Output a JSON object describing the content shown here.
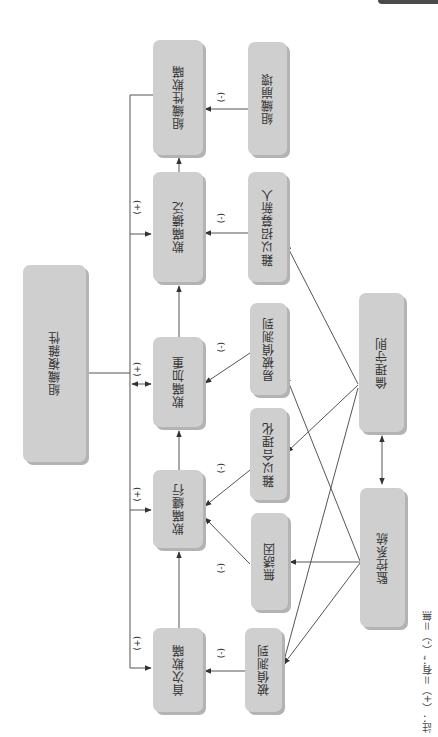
{
  "diagram": {
    "type": "causal-flow",
    "orientation": "rotated-90-ccw",
    "colors": {
      "node_fill": "#cfcfcf",
      "node_shadow": "#b3b3b3",
      "edge": "#555555",
      "text": "#333333"
    },
    "nodes": {
      "org_complexity": "組織複雜性",
      "org_deception": "組織性欺瞞",
      "deception_spread": "欺瞞擴泛",
      "deception_escalate": "欺瞞加重",
      "deception_continue": "欺瞞纏行",
      "first_deception": "首次欺瞞",
      "org_collapse": "組織崩壞",
      "hard_to_recruit": "難以招募新人",
      "easily_detected": "易被偵測到",
      "hard_to_rationalize": "難以合理化",
      "no_incentive": "無誘因",
      "detected": "被偵測到",
      "ethics_code": "倫理守則",
      "monitoring_system": "監控系統"
    },
    "signs": {
      "plus": "(+)",
      "minus": "(-)"
    },
    "edges": [
      {
        "from": "first_deception",
        "to": "deception_continue"
      },
      {
        "from": "deception_continue",
        "to": "deception_escalate"
      },
      {
        "from": "deception_escalate",
        "to": "deception_spread"
      },
      {
        "from": "deception_spread",
        "to": "org_deception"
      },
      {
        "from": "org_collapse",
        "to": "org_deception",
        "sign": "(-)"
      },
      {
        "from": "hard_to_recruit",
        "to": "deception_spread",
        "sign": "(-)"
      },
      {
        "from": "easily_detected",
        "to": "deception_escalate",
        "sign": "(-)"
      },
      {
        "from": "hard_to_rationalize",
        "to": "deception_continue",
        "sign": "(-)"
      },
      {
        "from": "no_incentive",
        "to": "deception_continue",
        "sign": "(-)"
      },
      {
        "from": "detected",
        "to": "first_deception",
        "sign": "(-)"
      },
      {
        "from": "org_complexity",
        "to": "deception_spread",
        "sign": "(+)"
      },
      {
        "from": "org_complexity",
        "to": "deception_escalate",
        "sign": "(+)",
        "bidirectional": true
      },
      {
        "from": "org_complexity",
        "to": "deception_continue",
        "sign": "(+)"
      },
      {
        "from": "org_complexity",
        "to": "first_deception",
        "sign": "(+)"
      },
      {
        "from": "org_deception",
        "to": "org_complexity"
      },
      {
        "from": "ethics_code",
        "to": "hard_to_recruit"
      },
      {
        "from": "ethics_code",
        "to": "hard_to_rationalize"
      },
      {
        "from": "ethics_code",
        "to": "detected"
      },
      {
        "from": "monitoring_system",
        "to": "easily_detected"
      },
      {
        "from": "monitoring_system",
        "to": "no_incentive"
      },
      {
        "from": "monitoring_system",
        "to": "detected"
      },
      {
        "from": "monitoring_system",
        "to": "ethics_code",
        "bidirectional": true
      }
    ],
    "note": "註：（+）＝有；（-）＝無"
  }
}
